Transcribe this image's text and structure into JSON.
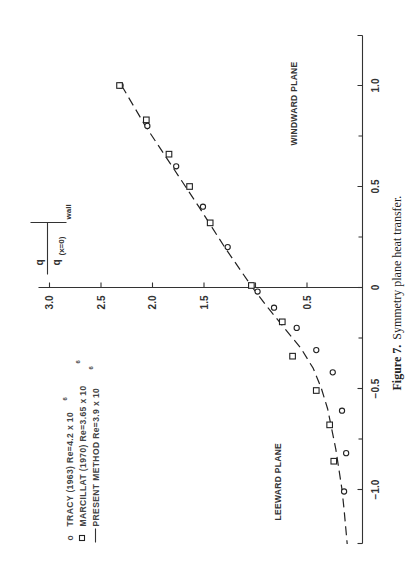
{
  "chart_data": {
    "type": "scatter",
    "title": "Symmetry plane heat transfer.",
    "caption": {
      "prefix": "Figure 7.",
      "text": "Symmetry plane heat transfer."
    },
    "orientation": "rotated -90deg on page",
    "xlabel": "",
    "ylabel": "q / q(x=0) wall",
    "ylabel_parts": {
      "num": "q",
      "den": "q",
      "sub": "(x=0)",
      "wall": "wall"
    },
    "xlim": [
      -1.3,
      1.25
    ],
    "ylim": [
      0,
      3.0
    ],
    "x_ticks": [
      -1.0,
      -0.5,
      0,
      0.5,
      1.0
    ],
    "x_tick_labels": [
      "−1.0",
      "−0.5",
      "0",
      "0.5",
      "1.0"
    ],
    "x_minor_ticks": [
      -0.75,
      -0.25,
      0.25,
      0.75
    ],
    "y_ticks": [
      0.5,
      1.0,
      1.5,
      2.0,
      2.5,
      3.0
    ],
    "y_tick_labels": [
      "0.5",
      "",
      "1.5",
      "2.0",
      "2.5",
      "3.0"
    ],
    "annotations": [
      "WINDWARD PLANE",
      "LEEWARD PLANE"
    ],
    "legend_position": "upper left",
    "series": [
      {
        "name": "TRACY (1963) Re=4.2 x 10^6",
        "marker": "circle",
        "x": [
          1.0,
          0.8,
          0.6,
          0.4,
          0.2,
          -0.02,
          -0.1,
          -0.2,
          -0.31,
          -0.42,
          -0.61,
          -0.82,
          -1.01
        ],
        "y": [
          2.31,
          2.05,
          1.77,
          1.51,
          1.27,
          0.98,
          0.82,
          0.6,
          0.41,
          0.25,
          0.16,
          0.12,
          0.14
        ]
      },
      {
        "name": "MARCILLAT (1970) Re=3.65 x 10^6",
        "marker": "square",
        "x": [
          1.0,
          0.83,
          0.66,
          0.5,
          0.32,
          0.01,
          -0.17,
          -0.34,
          -0.51,
          -0.68,
          -0.86
        ],
        "y": [
          2.32,
          2.06,
          1.84,
          1.64,
          1.44,
          1.04,
          0.74,
          0.64,
          0.41,
          0.28,
          0.24
        ]
      },
      {
        "name": "PRESENT METHOD Re=3.9 x 10^6",
        "marker": "dashed-line",
        "x": [
          1.0,
          0.8,
          0.6,
          0.4,
          0.2,
          0.0,
          -0.1,
          -0.2,
          -0.3,
          -0.4,
          -0.5,
          -0.6,
          -0.7,
          -0.8,
          -0.9,
          -1.0,
          -1.1,
          -1.27
        ],
        "y": [
          2.3,
          2.07,
          1.81,
          1.55,
          1.3,
          1.03,
          0.88,
          0.72,
          0.56,
          0.44,
          0.36,
          0.3,
          0.26,
          0.22,
          0.19,
          0.16,
          0.14,
          0.11
        ]
      }
    ]
  },
  "legend": {
    "items": [
      {
        "symbol": "o",
        "label": "TRACY (1963) Re=4.2 x 10",
        "exp": "6"
      },
      {
        "symbol": "□",
        "label": "MARCILLAT (1970)  Re=3.65 x 10",
        "exp": "6"
      },
      {
        "symbol": "—",
        "label": "PRESENT METHOD  Re=3.9 x 10",
        "exp": "6"
      }
    ]
  },
  "labels": {
    "windward": "WINDWARD PLANE",
    "leeward": "LEEWARD PLANE",
    "ylabel_num": "q",
    "ylabel_den": "q",
    "ylabel_sub": "(x=0)",
    "ylabel_wall": "wall",
    "caption_prefix": "Figure 7.",
    "caption_text": "Symmetry plane heat transfer."
  }
}
